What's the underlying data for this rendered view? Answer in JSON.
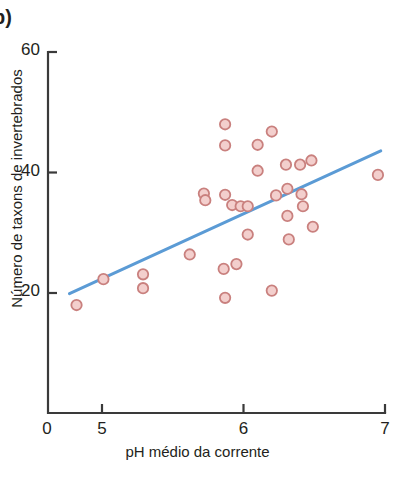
{
  "panel": {
    "letter": "b)"
  },
  "axes": {
    "x_title": "pH médio da corrente",
    "y_title": "Número de taxons de invertebrados",
    "x_ticks": [
      "0",
      "5",
      "6",
      "7"
    ],
    "y_ticks": [
      "20",
      "40",
      "60"
    ]
  },
  "colors": {
    "marker_fill": "#f3cfcd",
    "marker_edge": "#c9807e",
    "trend_line": "#5b9bd5",
    "axis": "#3a3a3a",
    "text": "#231f20"
  },
  "chart_data": {
    "type": "scatter",
    "title": "",
    "subtitle": "",
    "xlabel": "pH médio da corrente",
    "ylabel": "Número de taxons de invertebrados",
    "xlim": [
      4.28,
      7.0
    ],
    "ylim": [
      0,
      60
    ],
    "x_tick_values": [
      5,
      6,
      7
    ],
    "y_tick_values": [
      20,
      40,
      60
    ],
    "x_origin_label": "0",
    "grid": false,
    "legend": null,
    "annotations": [
      "b)"
    ],
    "points": [
      {
        "x": 4.82,
        "y": 18.0
      },
      {
        "x": 5.01,
        "y": 22.3
      },
      {
        "x": 5.29,
        "y": 23.1
      },
      {
        "x": 5.29,
        "y": 20.8
      },
      {
        "x": 5.62,
        "y": 26.4
      },
      {
        "x": 5.72,
        "y": 36.5
      },
      {
        "x": 5.73,
        "y": 35.4
      },
      {
        "x": 5.87,
        "y": 48.0
      },
      {
        "x": 5.87,
        "y": 44.5
      },
      {
        "x": 5.87,
        "y": 36.3
      },
      {
        "x": 5.86,
        "y": 24.0
      },
      {
        "x": 5.87,
        "y": 19.2
      },
      {
        "x": 5.92,
        "y": 34.6
      },
      {
        "x": 5.95,
        "y": 24.8
      },
      {
        "x": 5.98,
        "y": 34.4
      },
      {
        "x": 6.03,
        "y": 34.4
      },
      {
        "x": 6.03,
        "y": 29.7
      },
      {
        "x": 6.1,
        "y": 44.6
      },
      {
        "x": 6.1,
        "y": 40.3
      },
      {
        "x": 6.2,
        "y": 46.8
      },
      {
        "x": 6.2,
        "y": 20.4
      },
      {
        "x": 6.23,
        "y": 36.2
      },
      {
        "x": 6.3,
        "y": 41.3
      },
      {
        "x": 6.31,
        "y": 37.3
      },
      {
        "x": 6.31,
        "y": 32.8
      },
      {
        "x": 6.32,
        "y": 28.9
      },
      {
        "x": 6.4,
        "y": 41.3
      },
      {
        "x": 6.41,
        "y": 36.4
      },
      {
        "x": 6.42,
        "y": 34.4
      },
      {
        "x": 6.48,
        "y": 42.0
      },
      {
        "x": 6.49,
        "y": 31.0
      },
      {
        "x": 6.95,
        "y": 39.6
      }
    ],
    "trend_line": {
      "type": "linear-fit",
      "x_start": 4.77,
      "y_start": 19.9,
      "x_end": 6.97,
      "y_end": 43.6
    }
  }
}
